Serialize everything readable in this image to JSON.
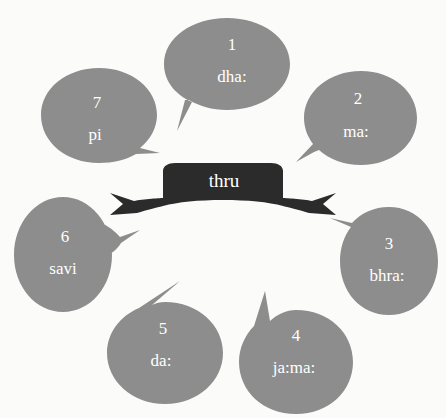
{
  "figure": {
    "type": "cycle-diagram",
    "background_color": "#fbfbfa",
    "bubble_color": "#8d8d8d",
    "banner_color": "#2b2b2b",
    "text_color": "#ffffff"
  },
  "center": {
    "label": "thru",
    "shape": "ribbon-banner"
  },
  "bubbles": [
    {
      "number": "1",
      "label": "dha:",
      "position": "top",
      "tail": "bottom-left"
    },
    {
      "number": "2",
      "label": "ma:",
      "position": "top-right",
      "tail": "bottom-left"
    },
    {
      "number": "3",
      "label": "bhra:",
      "position": "right",
      "tail": "left"
    },
    {
      "number": "4",
      "label": "ja:ma:",
      "position": "bottom-right",
      "tail": "top-left"
    },
    {
      "number": "5",
      "label": "da:",
      "position": "bottom-left",
      "tail": "top-right"
    },
    {
      "number": "6",
      "label": "savi",
      "position": "left",
      "tail": "right"
    },
    {
      "number": "7",
      "label": "pi",
      "position": "top-left",
      "tail": "bottom-right"
    }
  ]
}
